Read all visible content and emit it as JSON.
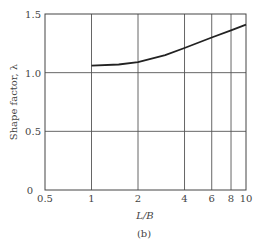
{
  "chart_data": {
    "type": "line",
    "title": "",
    "xlabel": "L/B",
    "ylabel": "Shape factor, λ",
    "caption": "(b)",
    "xscale": "log",
    "xlim": [
      0.5,
      10
    ],
    "ylim": [
      0,
      1.5
    ],
    "xticks": [
      "0.5",
      "1",
      "2",
      "4",
      "6",
      "8",
      "10"
    ],
    "yticks": [
      "0",
      "0.5",
      "1.0",
      "1.5"
    ],
    "grid": true,
    "series": [
      {
        "name": "Shape factor",
        "x": [
          1,
          1.5,
          2,
          3,
          4,
          6,
          8,
          10
        ],
        "y": [
          1.06,
          1.07,
          1.09,
          1.15,
          1.21,
          1.3,
          1.36,
          1.41
        ]
      }
    ]
  },
  "labels": {
    "xlabel": "L/B",
    "ylabel": "Shape factor, λ",
    "caption": "(b)",
    "xticks": [
      "0.5",
      "1",
      "2",
      "4",
      "6",
      "8",
      "10"
    ],
    "yticks": [
      "0",
      "0.5",
      "1.0",
      "1.5"
    ]
  }
}
